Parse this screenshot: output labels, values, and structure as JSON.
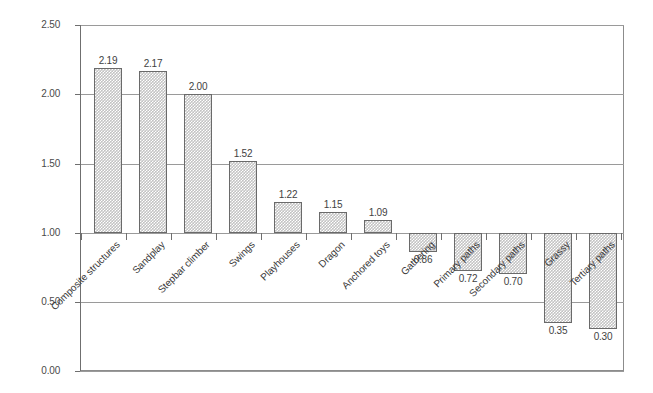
{
  "chart_data": {
    "type": "bar",
    "title": "",
    "subtitle": "",
    "xlabel": "",
    "ylabel": "",
    "ylim": [
      0.0,
      2.5
    ],
    "ytick_labels": [
      "0.00",
      "0.50",
      "1.00",
      "1.50",
      "2.00",
      "2.50"
    ],
    "ytick_values": [
      0.0,
      0.5,
      1.0,
      1.5,
      2.0,
      2.5
    ],
    "baseline": 1.0,
    "grid": "horizontal",
    "legend": "none",
    "categories": [
      "Composite structures",
      "Sandplay",
      "Stepbar climber",
      "Swings",
      "Playhouses",
      "Dragon",
      "Anchored toys",
      "Gathering",
      "Primary paths",
      "Secondary paths",
      "Grassy",
      "Tertiary paths"
    ],
    "values": [
      2.19,
      2.17,
      2.0,
      1.52,
      1.22,
      1.15,
      1.09,
      0.86,
      0.72,
      0.7,
      0.35,
      0.3
    ],
    "value_labels": [
      "2.19",
      "2.17",
      "2.00",
      "1.52",
      "1.22",
      "1.15",
      "1.09",
      "0.86",
      "0.72",
      "0.70",
      "0.35",
      "0.30"
    ],
    "colors": {
      "bar_fill": "#c3c3c3",
      "bar_border": "#6a6a6a",
      "gridline": "#9a9a9a",
      "axis": "#6f6f6f",
      "frame": "#8c8c8c",
      "text": "#3a3a3a",
      "background": "#ffffff"
    }
  }
}
